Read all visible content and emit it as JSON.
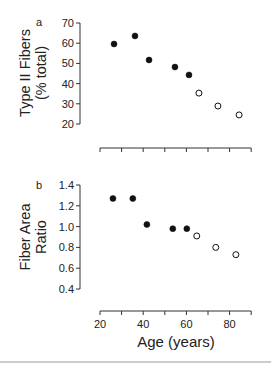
{
  "chart_data": [
    {
      "type": "scatter",
      "panel": "a",
      "title": "",
      "xlabel": "",
      "ylabel_line1": "Type II Fibers",
      "ylabel_line2": "(% total)",
      "xlim": [
        20,
        90
      ],
      "ylim": [
        20,
        70
      ],
      "yticks": [
        20,
        30,
        40,
        50,
        60,
        70
      ],
      "xticks": [
        20,
        30,
        40,
        50,
        60,
        70,
        80,
        90
      ],
      "grid": false,
      "series": [
        {
          "name": "filled",
          "marker": "filled-circle",
          "x": [
            26.5,
            36.2,
            42.7,
            54.7,
            61.2
          ],
          "y": [
            59.6,
            63.6,
            51.7,
            48.2,
            44.3
          ]
        },
        {
          "name": "open",
          "marker": "open-circle",
          "x": [
            65.8,
            74.6,
            84.4
          ],
          "y": [
            35.3,
            28.9,
            24.5
          ]
        }
      ]
    },
    {
      "type": "scatter",
      "panel": "b",
      "title": "",
      "xlabel": "Age (years)",
      "ylabel_line1": "Fiber Area",
      "ylabel_line2": "Ratio",
      "xlim": [
        20,
        90
      ],
      "ylim": [
        0.4,
        1.4
      ],
      "yticks": [
        "0.4",
        "0.6",
        "0.8",
        "1.0",
        "1.2",
        "1.4"
      ],
      "xticks": [
        20,
        30,
        40,
        50,
        60,
        70,
        80,
        90
      ],
      "xtick_labels": [
        "20",
        "40",
        "60",
        "80"
      ],
      "grid": false,
      "series": [
        {
          "name": "filled",
          "marker": "filled-circle",
          "x": [
            26.0,
            35.2,
            41.7,
            53.7,
            60.2
          ],
          "y": [
            1.27,
            1.27,
            1.02,
            0.98,
            0.98
          ]
        },
        {
          "name": "open",
          "marker": "open-circle",
          "x": [
            64.8,
            73.6,
            82.9
          ],
          "y": [
            0.91,
            0.8,
            0.73
          ]
        }
      ]
    }
  ],
  "labels": {
    "panel_a": "a",
    "panel_b": "b",
    "a_ylabel_1": "Type II Fibers",
    "a_ylabel_2": "(% total)",
    "b_ylabel_1": "Fiber Area",
    "b_ylabel_2": "Ratio",
    "xlabel": "Age (years)"
  }
}
